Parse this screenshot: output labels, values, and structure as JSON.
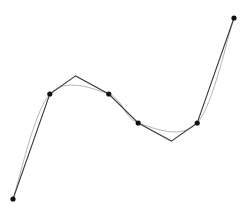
{
  "diagram": {
    "colors": {
      "polyline": "#3a3a3a",
      "curve": "#b5b5b5",
      "points": "#111111",
      "background": "#ffffff"
    },
    "data_points": [
      {
        "id": "p1",
        "x": 0.0,
        "y": 0.0
      },
      {
        "id": "p2",
        "x": 1.0,
        "y": 2.9
      },
      {
        "id": "p3",
        "x": 2.6,
        "y": 2.9
      },
      {
        "id": "p4",
        "x": 3.4,
        "y": 2.1
      },
      {
        "id": "p5",
        "x": 5.0,
        "y": 2.1
      },
      {
        "id": "p6",
        "x": 6.0,
        "y": 5.0
      }
    ],
    "polyline_vertices": [
      {
        "x": 0.0,
        "y": 0.0
      },
      {
        "x": 1.0,
        "y": 2.9
      },
      {
        "x": 1.7,
        "y": 3.4
      },
      {
        "x": 2.6,
        "y": 2.9
      },
      {
        "x": 3.4,
        "y": 2.1
      },
      {
        "x": 4.3,
        "y": 1.6
      },
      {
        "x": 5.0,
        "y": 2.1
      },
      {
        "x": 6.0,
        "y": 5.0
      }
    ],
    "domain": {
      "x": [
        0,
        6
      ],
      "y": [
        0,
        5
      ]
    }
  }
}
